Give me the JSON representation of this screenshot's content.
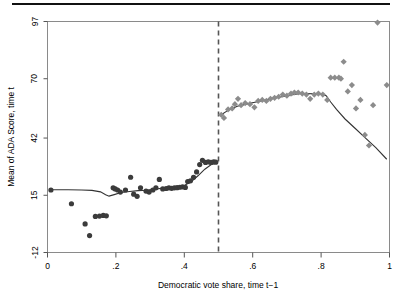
{
  "figure": {
    "title": "",
    "top_rule": true
  },
  "chart_data": {
    "type": "scatter",
    "title": "",
    "subtitle": "",
    "xlabel": "Democratic vote share, time t−1",
    "ylabel": "Mean of ADA Score, time t",
    "xlim": [
      0,
      1
    ],
    "ylim": [
      -12,
      97
    ],
    "xticks": [
      0,
      0.2,
      0.4,
      0.6,
      0.8,
      1
    ],
    "xticklabels": [
      "0",
      ".2",
      ".4",
      ".6",
      ".8",
      "1"
    ],
    "yticks": [
      -12,
      15,
      42,
      70,
      97
    ],
    "yticklabels": [
      "-12",
      "15",
      "42",
      "70",
      "97"
    ],
    "grid": false,
    "legend": "none",
    "annotations": [
      {
        "name": "discontinuity-cutoff",
        "type": "vline",
        "x": 0.5,
        "style": "dashed"
      }
    ],
    "series": [
      {
        "name": "Democrat loss (below cutoff)",
        "marker": "circle",
        "color": "#3b3b3b",
        "x": [
          0.01,
          0.07,
          0.11,
          0.123,
          0.14,
          0.152,
          0.163,
          0.172,
          0.192,
          0.198,
          0.205,
          0.213,
          0.228,
          0.243,
          0.252,
          0.262,
          0.272,
          0.288,
          0.297,
          0.308,
          0.317,
          0.327,
          0.337,
          0.347,
          0.355,
          0.363,
          0.371,
          0.379,
          0.387,
          0.395,
          0.403,
          0.41,
          0.418,
          0.427,
          0.436,
          0.445,
          0.453,
          0.462,
          0.47,
          0.478,
          0.486,
          0.492
        ],
        "y": [
          17.5,
          11.0,
          1.5,
          -4.0,
          5.0,
          5.2,
          5.5,
          5.3,
          18.5,
          18.0,
          17.5,
          16.5,
          17.5,
          23.5,
          15.5,
          14.5,
          18.5,
          17.0,
          16.5,
          17.5,
          18.5,
          22.5,
          18.0,
          18.2,
          18.5,
          18.3,
          18.5,
          18.6,
          18.8,
          19.0,
          18.7,
          21.5,
          21.8,
          23.5,
          26.0,
          29.5,
          31.5,
          30.5,
          30.8,
          30.5,
          30.8,
          30.6
        ]
      },
      {
        "name": "Democrat win (above cutoff)",
        "marker": "diamond",
        "color": "#8c8c8c",
        "x": [
          0.508,
          0.516,
          0.528,
          0.54,
          0.548,
          0.557,
          0.566,
          0.578,
          0.592,
          0.605,
          0.616,
          0.628,
          0.64,
          0.652,
          0.664,
          0.676,
          0.688,
          0.7,
          0.712,
          0.722,
          0.733,
          0.745,
          0.757,
          0.768,
          0.78,
          0.792,
          0.805,
          0.818,
          0.828,
          0.84,
          0.852,
          0.858,
          0.866,
          0.878,
          0.89,
          0.902,
          0.915,
          0.928,
          0.94,
          0.952,
          0.965,
          0.992
        ],
        "y": [
          53.0,
          51.5,
          55.5,
          56.0,
          58.0,
          60.5,
          57.5,
          58.5,
          58.0,
          56.5,
          59.5,
          60.0,
          59.5,
          60.5,
          61.0,
          61.5,
          62.5,
          62.0,
          63.0,
          63.5,
          63.5,
          63.0,
          62.5,
          60.5,
          62.5,
          63.0,
          62.5,
          60.0,
          70.5,
          70.5,
          70.5,
          70.0,
          78.0,
          64.0,
          67.0,
          56.0,
          60.0,
          43.5,
          38.5,
          57.5,
          96.5,
          67.0
        ]
      }
    ],
    "fit_lines": [
      {
        "name": "local-polynomial-fit-left",
        "x": [
          0.01,
          0.06,
          0.1,
          0.13,
          0.155,
          0.17,
          0.18,
          0.195,
          0.215,
          0.24,
          0.265,
          0.29,
          0.315,
          0.34,
          0.36,
          0.38,
          0.4,
          0.42,
          0.44,
          0.46,
          0.478,
          0.492
        ],
        "y": [
          17.6,
          17.6,
          17.5,
          17.3,
          16.6,
          15.3,
          14.6,
          15.3,
          16.3,
          16.8,
          17.2,
          17.4,
          17.9,
          18.4,
          18.7,
          19.0,
          19.6,
          21.4,
          24.2,
          27.3,
          29.4,
          30.2
        ]
      },
      {
        "name": "local-polynomial-fit-right",
        "x": [
          0.508,
          0.53,
          0.555,
          0.58,
          0.61,
          0.64,
          0.67,
          0.7,
          0.73,
          0.755,
          0.78,
          0.8,
          0.815,
          0.828,
          0.845,
          0.87,
          0.9,
          0.93,
          0.96,
          0.992
        ],
        "y": [
          53.0,
          55.3,
          57.0,
          58.0,
          59.0,
          60.0,
          61.0,
          62.0,
          62.8,
          63.0,
          62.9,
          62.6,
          62.0,
          59.0,
          55.5,
          51.0,
          46.5,
          42.0,
          37.5,
          32.0
        ]
      }
    ]
  }
}
